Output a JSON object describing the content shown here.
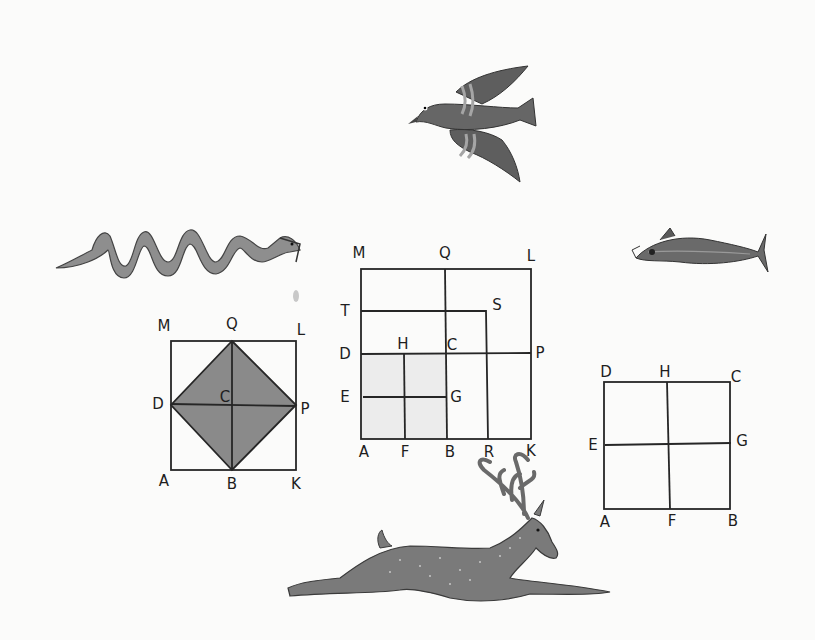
{
  "figures": {
    "fig_left": {
      "description": "Square with inscribed shaded diamond",
      "labels": [
        {
          "t": "M",
          "x": 164,
          "y": 326
        },
        {
          "t": "Q",
          "x": 232,
          "y": 324
        },
        {
          "t": "L",
          "x": 301,
          "y": 330
        },
        {
          "t": "D",
          "x": 158,
          "y": 404
        },
        {
          "t": "C",
          "x": 225,
          "y": 397
        },
        {
          "t": "P",
          "x": 305,
          "y": 409
        },
        {
          "t": "A",
          "x": 164,
          "y": 481
        },
        {
          "t": "B",
          "x": 232,
          "y": 484
        },
        {
          "t": "K",
          "x": 296,
          "y": 484
        }
      ],
      "shade_color": "#8a8a8a"
    },
    "fig_center": {
      "description": "Square MLKA with gnomon construction",
      "labels": [
        {
          "t": "M",
          "x": 359,
          "y": 253
        },
        {
          "t": "Q",
          "x": 445,
          "y": 253
        },
        {
          "t": "L",
          "x": 531,
          "y": 256
        },
        {
          "t": "T",
          "x": 345,
          "y": 311
        },
        {
          "t": "S",
          "x": 497,
          "y": 305
        },
        {
          "t": "D",
          "x": 345,
          "y": 354
        },
        {
          "t": "H",
          "x": 403,
          "y": 344
        },
        {
          "t": "C",
          "x": 452,
          "y": 345
        },
        {
          "t": "P",
          "x": 540,
          "y": 353
        },
        {
          "t": "E",
          "x": 345,
          "y": 397
        },
        {
          "t": "G",
          "x": 456,
          "y": 397
        },
        {
          "t": "A",
          "x": 364,
          "y": 452
        },
        {
          "t": "F",
          "x": 405,
          "y": 452
        },
        {
          "t": "B",
          "x": 450,
          "y": 452
        },
        {
          "t": "R",
          "x": 489,
          "y": 452
        },
        {
          "t": "K",
          "x": 531,
          "y": 451
        }
      ],
      "shade_color": "#ececec"
    },
    "fig_right": {
      "description": "Square ABCD divided into four",
      "labels": [
        {
          "t": "D",
          "x": 606,
          "y": 372
        },
        {
          "t": "H",
          "x": 665,
          "y": 372
        },
        {
          "t": "C",
          "x": 736,
          "y": 377
        },
        {
          "t": "E",
          "x": 593,
          "y": 445
        },
        {
          "t": "G",
          "x": 742,
          "y": 441
        },
        {
          "t": "A",
          "x": 605,
          "y": 522
        },
        {
          "t": "F",
          "x": 672,
          "y": 521
        },
        {
          "t": "B",
          "x": 733,
          "y": 521
        }
      ]
    }
  },
  "illustrations": [
    "bird",
    "serpent",
    "fish",
    "stag"
  ],
  "colors": {
    "ink": "#262626",
    "animal_fill": "#6d6d6d",
    "animal_dark": "#4a4a4a",
    "animal_light": "#a0a0a0"
  }
}
